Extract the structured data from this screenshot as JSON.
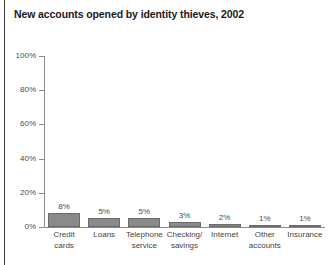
{
  "chart_data": {
    "type": "bar",
    "title": "New accounts opened by identity thieves, 2002",
    "xlabel": "",
    "ylabel": "",
    "ylim": [
      0,
      100
    ],
    "yticks": [
      0,
      20,
      40,
      60,
      80,
      100
    ],
    "ytick_labels": [
      "0%",
      "20%",
      "40%",
      "60%",
      "80%",
      "100%"
    ],
    "grid": false,
    "legend": "none",
    "categories": [
      "Credit\ncards",
      "Loans",
      "Telephone\nservice",
      "Checking/\nsavings",
      "Internet",
      "Other\naccounts",
      "Insurance"
    ],
    "values": [
      8,
      5,
      5,
      3,
      2,
      1,
      1
    ],
    "value_labels": [
      "8%",
      "5%",
      "5%",
      "3%",
      "2%",
      "1%",
      "1%"
    ],
    "bar_color": "#8a8a8a",
    "bar_border_color": "#6a6a6a",
    "axis_color": "#8c8c8c",
    "title_color": "#1a1a1a",
    "label_color": "#4a4a4a",
    "background": "#ffffff"
  }
}
